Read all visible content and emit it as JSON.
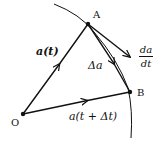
{
  "diagram": {
    "type": "vector-derivative-diagram",
    "colors": {
      "stroke": "#111111",
      "background": "#ffffff"
    },
    "points": {
      "O": {
        "label": "O",
        "x": 23,
        "y": 114
      },
      "A": {
        "label": "A",
        "x": 88,
        "y": 24
      },
      "B": {
        "label": "B",
        "x": 130,
        "y": 92
      }
    },
    "vectors": [
      {
        "id": "a_t",
        "from": "O",
        "to": "A",
        "label": "a(t)"
      },
      {
        "id": "a_t_dt",
        "from": "O",
        "to": "B",
        "label": "a(t + Δt)"
      },
      {
        "id": "delta_a",
        "from": "A",
        "to": "B",
        "label": "Δa"
      },
      {
        "id": "derivative",
        "from": "A",
        "direction": "tangent",
        "label_num": "da",
        "label_den": "dt"
      }
    ],
    "curve": {
      "description": "trajectory arc through A and B"
    }
  }
}
